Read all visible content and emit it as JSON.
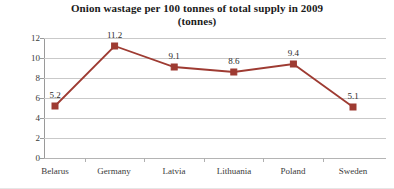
{
  "chart_data": {
    "type": "line",
    "title": "Onion wastage per 100 tonnes of total supply in 2009 (tonnes)",
    "title_lines": [
      "Onion wastage per 100 tonnes of total supply in 2009",
      "(tonnes)"
    ],
    "categories": [
      "Belarus",
      "Germany",
      "Latvia",
      "Lithuania",
      "Poland",
      "Sweden"
    ],
    "values": [
      5.2,
      11.2,
      9.1,
      8.6,
      9.4,
      5.1
    ],
    "point_labels": [
      "5.2",
      "11.2",
      "9.1",
      "8.6",
      "9.4",
      "5.1"
    ],
    "xlabel": "",
    "ylabel": "",
    "ylim": [
      0,
      12
    ],
    "yticks": [
      0,
      2,
      4,
      6,
      8,
      10,
      12
    ],
    "ytick_labels": [
      "0",
      "2",
      "4",
      "6",
      "8",
      "10",
      "12"
    ],
    "grid": true,
    "legend": false,
    "series_color": "#9E3B32",
    "marker": "square",
    "gridline_color": "#C9C9C9",
    "axis_color": "#9A9A9A",
    "text_color": "#2B2B2B"
  }
}
